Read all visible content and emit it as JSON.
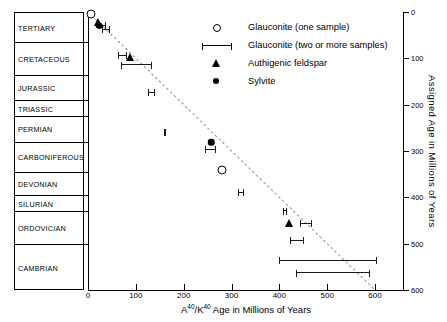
{
  "chart_data": {
    "type": "scatter",
    "title": "",
    "xlabel": "A40/K40 Age in Millions of Years",
    "ylabel": "Assigned Age in Millions of Years",
    "xlim": [
      0,
      600
    ],
    "ylim": [
      0,
      600
    ],
    "x_ticks": [
      0,
      100,
      200,
      300,
      400,
      500,
      600
    ],
    "x_tick_labels": [
      "0",
      "100",
      "200",
      "300",
      "400",
      "500",
      "600"
    ],
    "y_ticks": [
      0,
      100,
      200,
      300,
      400,
      500,
      600
    ],
    "y_tick_labels": [
      "0",
      "100",
      "200",
      "300",
      "400",
      "500",
      "600"
    ],
    "grid": false,
    "legend_position": "top-right",
    "trendline": {
      "style": "dashed",
      "x0": 0,
      "y0": 0,
      "x1": 600,
      "y1": 600
    },
    "series": [
      {
        "name": "Glauconite (one sample)",
        "marker": "open-circle",
        "points": [
          {
            "x": 7,
            "y": 4
          },
          {
            "x": 280,
            "y": 340
          }
        ]
      },
      {
        "name": "Glauconite (two or more samples)",
        "marker": "h-errorbar",
        "points": [
          {
            "x": 30,
            "xlo": 22,
            "xhi": 38,
            "y": 28
          },
          {
            "x": 37,
            "xlo": 30,
            "xhi": 45,
            "y": 36
          },
          {
            "x": 72,
            "xlo": 62,
            "xhi": 82,
            "y": 92
          },
          {
            "x": 100,
            "xlo": 68,
            "xhi": 133,
            "y": 113
          },
          {
            "x": 132,
            "xlo": 125,
            "xhi": 140,
            "y": 172
          },
          {
            "x": 161,
            "xlo": 158,
            "xhi": 164,
            "y": 258
          },
          {
            "x": 256,
            "xlo": 245,
            "xhi": 268,
            "y": 295
          },
          {
            "x": 320,
            "xlo": 313,
            "xhi": 327,
            "y": 388
          },
          {
            "x": 412,
            "xlo": 408,
            "xhi": 416,
            "y": 428
          },
          {
            "x": 455,
            "xlo": 443,
            "xhi": 468,
            "y": 455
          },
          {
            "x": 437,
            "xlo": 423,
            "xhi": 452,
            "y": 492
          },
          {
            "x": 502,
            "xlo": 400,
            "xhi": 605,
            "y": 535
          },
          {
            "x": 512,
            "xlo": 435,
            "xhi": 590,
            "y": 562
          }
        ]
      },
      {
        "name": "Authigenic feldspar",
        "marker": "filled-triangle",
        "points": [
          {
            "x": 20,
            "y": 22
          },
          {
            "x": 88,
            "y": 97
          },
          {
            "x": 420,
            "y": 455
          }
        ]
      },
      {
        "name": "Sylvite",
        "marker": "filled-circle",
        "points": [
          {
            "x": 24,
            "y": 30
          },
          {
            "x": 258,
            "y": 281
          }
        ]
      }
    ]
  },
  "legend": {
    "items": [
      {
        "symbol": "open-circle",
        "label": "Glauconite (one sample)"
      },
      {
        "symbol": "h-errorbar",
        "label": "Glauconite (two or more samples)"
      },
      {
        "symbol": "filled-triangle",
        "label": "Authigenic feldspar"
      },
      {
        "symbol": "filled-circle",
        "label": "Sylvite"
      }
    ]
  },
  "periods": {
    "label": "Geologic periods",
    "items": [
      {
        "name": "TERTIARY",
        "top_ma": 0,
        "base_ma": 65
      },
      {
        "name": "CRETACEOUS",
        "top_ma": 65,
        "base_ma": 136
      },
      {
        "name": "JURASSIC",
        "top_ma": 136,
        "base_ma": 190
      },
      {
        "name": "TRIASSIC",
        "top_ma": 190,
        "base_ma": 225
      },
      {
        "name": "PERMIAN",
        "top_ma": 225,
        "base_ma": 280
      },
      {
        "name": "CARBONIFEROUS",
        "top_ma": 280,
        "base_ma": 345
      },
      {
        "name": "DEVONIAN",
        "top_ma": 345,
        "base_ma": 395
      },
      {
        "name": "SILURIAN",
        "top_ma": 395,
        "base_ma": 430
      },
      {
        "name": "ORDOVICIAN",
        "top_ma": 430,
        "base_ma": 500
      },
      {
        "name": "CAMBRIAN",
        "top_ma": 500,
        "base_ma": 600
      }
    ]
  },
  "axes": {
    "x_title_main": "Age in Millions of Years",
    "x_title_iso_a": "A",
    "x_title_iso_a_sup": "40",
    "x_title_slash": "/K",
    "x_title_iso_k_sup": "40",
    "y_title": "Assigned Age in Millions of Years"
  }
}
